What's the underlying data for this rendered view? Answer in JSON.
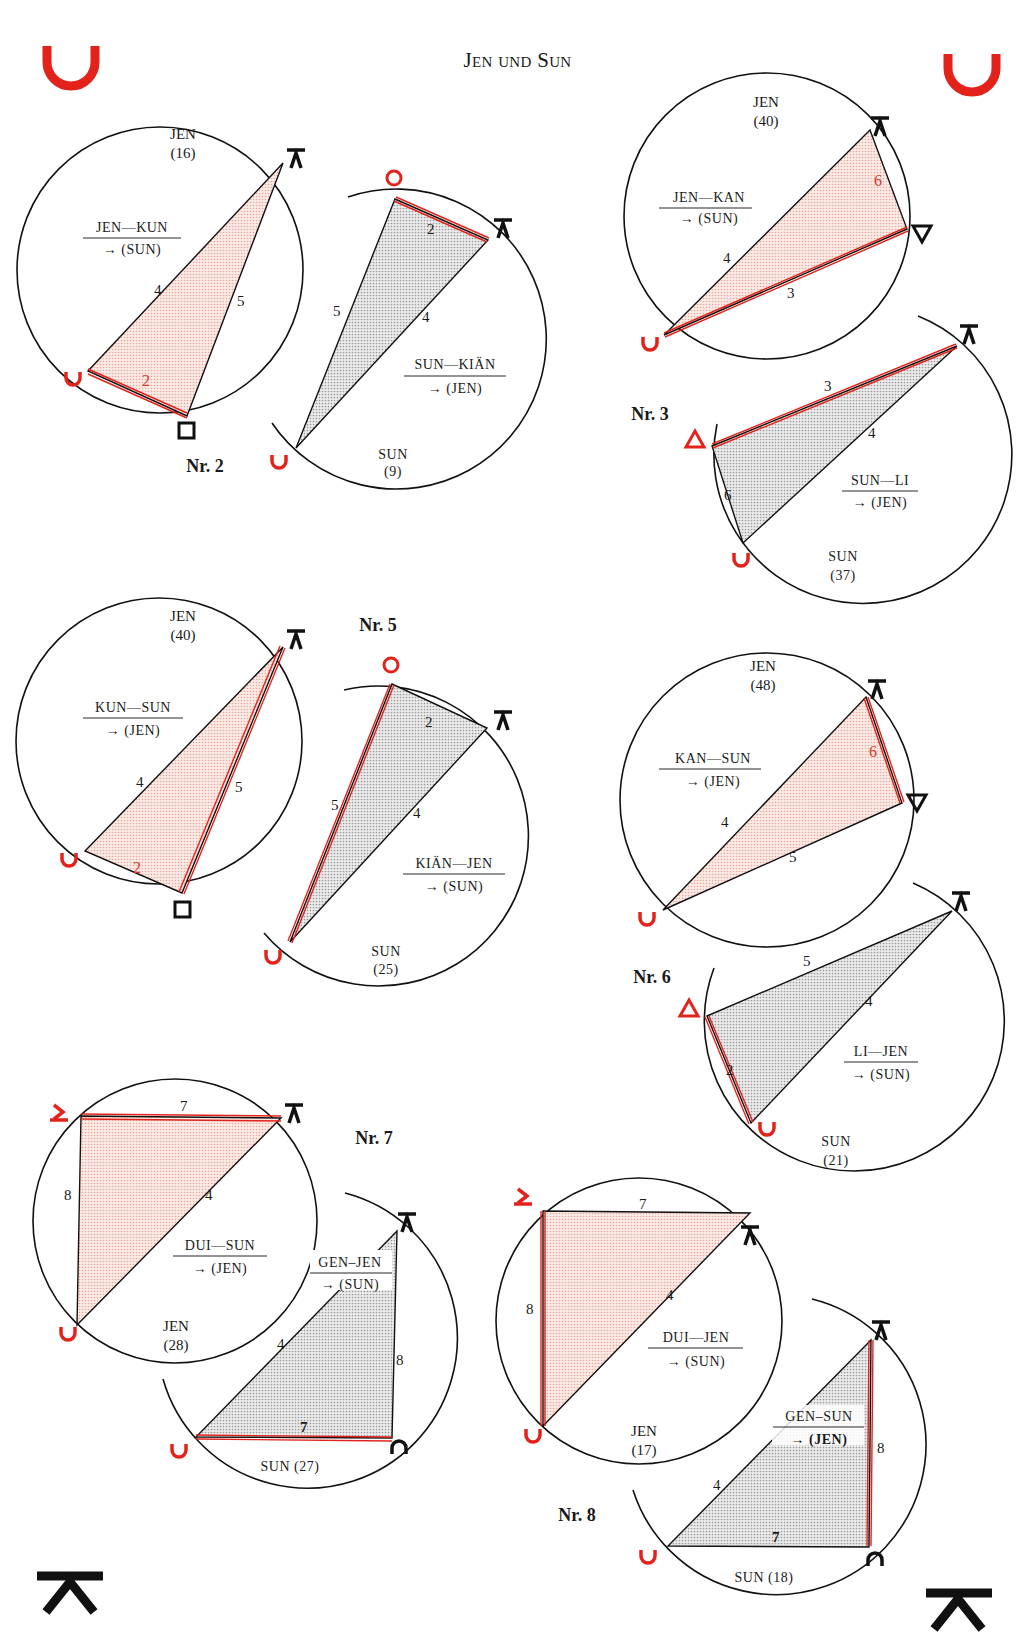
{
  "page": {
    "title": "Jen und Sun",
    "colors": {
      "accent_red": "#e3231b",
      "ink": "#1a1a1a",
      "red_fill": "#f6dcd6",
      "grey_fill": "#d9d9d9",
      "edge_red": "#d63a2a"
    },
    "corner_symbols": {
      "top_left": "trigram-u-red",
      "top_right": "trigram-u-red",
      "bottom_left": "trigram-k-black",
      "bottom_right": "trigram-k-black"
    }
  },
  "diagrams": [
    {
      "nr": "Nr. 2",
      "upper": {
        "name": "JEN",
        "number": "(16)",
        "pair": "JEN—KUN",
        "target": "→ (SUN)",
        "sides": [
          "4",
          "5",
          "2"
        ]
      },
      "lower": {
        "name": "SUN",
        "number": "(9)",
        "pair": "SUN—KIÄN",
        "target": "→ (JEN)",
        "sides": [
          "5",
          "4",
          "2"
        ]
      }
    },
    {
      "nr": "Nr. 3",
      "upper": {
        "name": "JEN",
        "number": "(40)",
        "pair": "JEN—KAN",
        "target": "→ (SUN)",
        "sides": [
          "4",
          "3",
          "6"
        ]
      },
      "lower": {
        "name": "SUN",
        "number": "(37)",
        "pair": "SUN—LI",
        "target": "→ (JEN)",
        "sides": [
          "3",
          "4",
          "6"
        ]
      }
    },
    {
      "nr": "Nr. 5",
      "upper": {
        "name": "JEN",
        "number": "(40)",
        "pair": "KUN—SUN",
        "target": "→ (JEN)",
        "sides": [
          "4",
          "5",
          "2"
        ]
      },
      "lower": {
        "name": "SUN",
        "number": "(25)",
        "pair": "KIÄN—JEN",
        "target": "→ (SUN)",
        "sides": [
          "5",
          "4",
          "2"
        ]
      }
    },
    {
      "nr": "Nr. 6",
      "upper": {
        "name": "JEN",
        "number": "(48)",
        "pair": "KAN—SUN",
        "target": "→ (JEN)",
        "sides": [
          "4",
          "5",
          "6"
        ]
      },
      "lower": {
        "name": "SUN",
        "number": "(21)",
        "pair": "LI—JEN",
        "target": "→ (SUN)",
        "sides": [
          "5",
          "4",
          "2"
        ]
      }
    },
    {
      "nr": "Nr. 7",
      "upper": {
        "name": "JEN",
        "number": "(28)",
        "pair": "DUI—SUN",
        "target": "→ (JEN)",
        "sides": [
          "7",
          "8",
          "4"
        ]
      },
      "lower": {
        "name": "SUN",
        "number": "(27)",
        "label": "SUN (27)",
        "pair": "GEN–JEN",
        "target": "→ (SUN)",
        "sides": [
          "4",
          "8",
          "7"
        ]
      }
    },
    {
      "nr": "Nr. 8",
      "upper": {
        "name": "JEN",
        "number": "(17)",
        "pair": "DUI—JEN",
        "target": "→ (SUN)",
        "sides": [
          "7",
          "8",
          "4"
        ]
      },
      "lower": {
        "name": "SUN",
        "number": "(18)",
        "label": "SUN (18)",
        "pair": "GEN–SUN",
        "target": "→ (JEN)",
        "sides": [
          "4",
          "8",
          "7"
        ]
      }
    }
  ]
}
